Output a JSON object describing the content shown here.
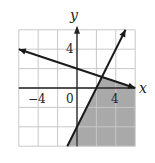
{
  "chart_data": {
    "type": "line",
    "title": "",
    "xlabel": "x",
    "ylabel": "y",
    "xlim": [
      -6,
      6
    ],
    "ylim": [
      -6,
      6
    ],
    "grid": true,
    "grid_step": 2,
    "tick_labels": {
      "x": [
        {
          "value": -4,
          "label": "−4"
        },
        {
          "value": 0,
          "label": "0"
        },
        {
          "value": 4,
          "label": "4"
        }
      ],
      "y": [
        {
          "value": 4,
          "label": "4"
        }
      ]
    },
    "series": [
      {
        "name": "boundary-1",
        "equation": "y = -x/3 + 2",
        "slope": -0.3333,
        "intercept": 2,
        "x": [
          -6,
          6
        ],
        "y": [
          4,
          0
        ],
        "style": "solid",
        "arrows": "both"
      },
      {
        "name": "boundary-2",
        "equation": "y = 2x - 4",
        "slope": 2,
        "intercept": -4,
        "x": [
          -1,
          5
        ],
        "y": [
          -6,
          6
        ],
        "style": "solid",
        "arrows": "both"
      }
    ],
    "intersection": {
      "x": 2.57,
      "y": 1.14
    },
    "shaded_region": {
      "description": "y <= -x/3 + 2 and y >= 2x - 4",
      "polygon": [
        [
          -1,
          -6
        ],
        [
          2.57,
          1.14
        ],
        [
          6,
          0
        ],
        [
          6,
          -6
        ]
      ],
      "color": "#a9a9a9"
    }
  },
  "labels": {
    "x_axis": "x",
    "y_axis": "y",
    "x_neg4": "−4",
    "x_0": "0",
    "x_4": "4",
    "y_4": "4"
  },
  "colors": {
    "grid": "#c8c8c8",
    "axis": "#222222",
    "line": "#1a1a1a",
    "shade": "#a9a9a9"
  }
}
